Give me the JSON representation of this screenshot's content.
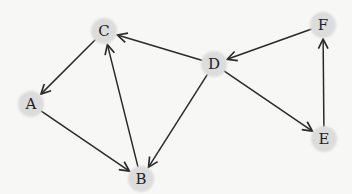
{
  "diagram": {
    "type": "directed-graph",
    "colors": {
      "background": "#f7f7f5",
      "node_fill": "#dcdcdc",
      "edge": "#2a2a2a",
      "label": "#222222"
    },
    "nodes": [
      {
        "id": "A",
        "label": "A",
        "x": 31,
        "y": 104
      },
      {
        "id": "B",
        "label": "B",
        "x": 141,
        "y": 179
      },
      {
        "id": "C",
        "label": "C",
        "x": 104,
        "y": 31
      },
      {
        "id": "D",
        "label": "D",
        "x": 214,
        "y": 64
      },
      {
        "id": "E",
        "label": "E",
        "x": 324,
        "y": 139
      },
      {
        "id": "F",
        "label": "F",
        "x": 323,
        "y": 25
      }
    ],
    "edges": [
      {
        "from": "D",
        "to": "C"
      },
      {
        "from": "F",
        "to": "D"
      },
      {
        "from": "C",
        "to": "A"
      },
      {
        "from": "A",
        "to": "B"
      },
      {
        "from": "B",
        "to": "C"
      },
      {
        "from": "D",
        "to": "B"
      },
      {
        "from": "D",
        "to": "E"
      },
      {
        "from": "E",
        "to": "F"
      }
    ]
  }
}
